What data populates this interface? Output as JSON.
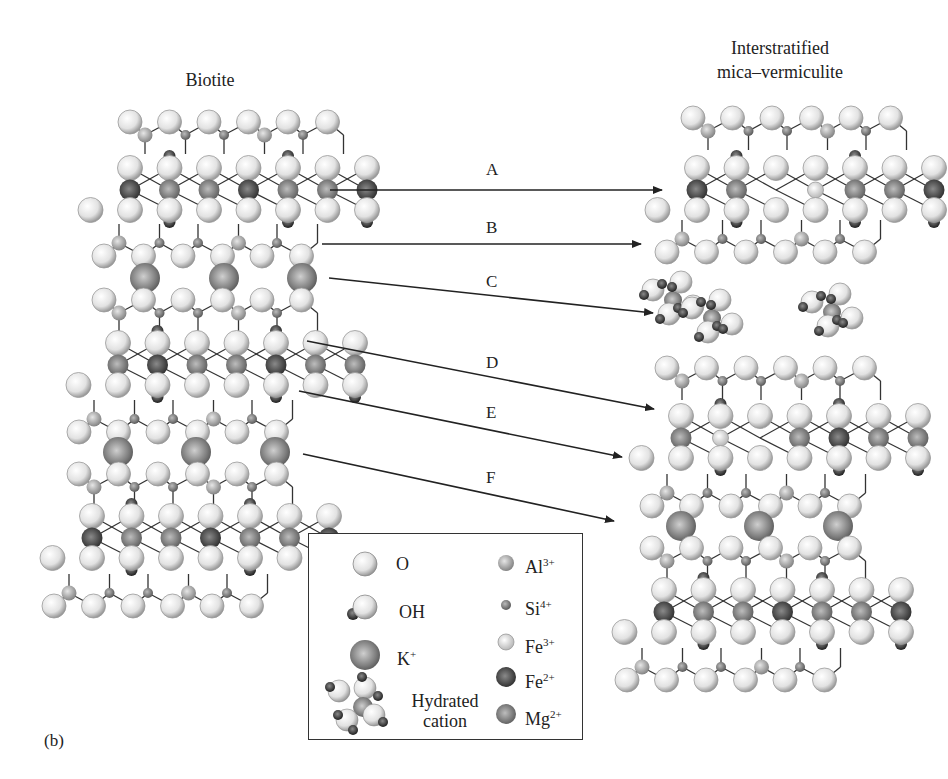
{
  "titles": {
    "left": "Biotite",
    "right_line1": "Interstratified",
    "right_line2": "mica–vermiculite"
  },
  "panel_label": "(b)",
  "colors": {
    "O": "#e8e8e8",
    "OH_h": "#3a3a3a",
    "K": "#8a8a8a",
    "Al": "#a6a6a6",
    "Si": "#8c8c8c",
    "Fe3": "#ececec",
    "Fe2": "#4a4a4a",
    "Mg": "#777777",
    "bond": "#333333",
    "arrow": "#222222"
  },
  "arrows": [
    {
      "label": "A",
      "x1": 330,
      "y1": 190,
      "x2": 662,
      "y2": 190,
      "lx": 486,
      "ly": 160
    },
    {
      "label": "B",
      "x1": 322,
      "y1": 244,
      "x2": 641,
      "y2": 244,
      "lx": 486,
      "ly": 218
    },
    {
      "label": "C",
      "x1": 329,
      "y1": 278,
      "x2": 653,
      "y2": 313,
      "lx": 486,
      "ly": 272
    },
    {
      "label": "D",
      "x1": 307,
      "y1": 341,
      "x2": 654,
      "y2": 409,
      "lx": 486,
      "ly": 353
    },
    {
      "label": "E",
      "x1": 299,
      "y1": 391,
      "x2": 622,
      "y2": 457,
      "lx": 486,
      "ly": 403
    },
    {
      "label": "F",
      "x1": 303,
      "y1": 454,
      "x2": 614,
      "y2": 521,
      "lx": 486,
      "ly": 468
    }
  ],
  "legend": {
    "items_left": [
      {
        "symbol": "O",
        "label": "O",
        "sup": ""
      },
      {
        "symbol": "OH",
        "label": "OH",
        "sup": ""
      },
      {
        "symbol": "K",
        "label": "K",
        "sup": "+"
      },
      {
        "symbol": "hydrated",
        "label": "Hydrated",
        "label2": "cation",
        "sup": ""
      }
    ],
    "items_right": [
      {
        "symbol": "Al",
        "label": "Al",
        "sup": "3+"
      },
      {
        "symbol": "Si",
        "label": "Si",
        "sup": "4+"
      },
      {
        "symbol": "Fe3",
        "label": "Fe",
        "sup": "3+"
      },
      {
        "symbol": "Fe2",
        "label": "Fe",
        "sup": "2+"
      },
      {
        "symbol": "Mg",
        "label": "Mg",
        "sup": "2+"
      }
    ]
  },
  "structures": {
    "biotite": {
      "x0": 130,
      "pitch": 39.5,
      "layers": [
        {
          "type": "tet",
          "y": 122,
          "shift": 0,
          "count": 6
        },
        {
          "type": "oct",
          "y": 190,
          "shift": 0,
          "cations": [
            "Fe2",
            "Mg",
            "Mg",
            "Fe2",
            "Mg",
            "Mg",
            "Fe2"
          ]
        },
        {
          "type": "tet_inv",
          "y": 256,
          "shift": -26,
          "count": 6
        },
        {
          "type": "K",
          "y": 278,
          "positions": [
            145,
            224,
            302
          ]
        },
        {
          "type": "tet",
          "y": 300,
          "shift": -26,
          "count": 6
        },
        {
          "type": "oct",
          "y": 365,
          "shift": -12,
          "cations": [
            "Mg",
            "Fe2",
            "Mg",
            "Mg",
            "Fe2",
            "Mg",
            "Mg"
          ]
        },
        {
          "type": "tet_inv",
          "y": 432,
          "shift": -51,
          "count": 6
        },
        {
          "type": "K",
          "y": 452,
          "positions": [
            118,
            196,
            275
          ]
        },
        {
          "type": "tet",
          "y": 474,
          "shift": -51,
          "count": 6
        },
        {
          "type": "oct",
          "y": 538,
          "shift": -38,
          "cations": [
            "Fe2",
            "Mg",
            "Mg",
            "Fe2",
            "Mg",
            "Mg",
            "Fe2"
          ]
        },
        {
          "type": "tet_inv",
          "y": 606,
          "shift": -76,
          "count": 6
        }
      ]
    },
    "mica_vermiculite": {
      "x0": 697,
      "pitch": 39.5,
      "layers": [
        {
          "type": "tet",
          "y": 118,
          "shift": -4,
          "count": 6
        },
        {
          "type": "oct",
          "y": 190,
          "shift": 0,
          "cations": [
            "Fe2",
            "Mg",
            "",
            "Fe3",
            "Mg",
            "Mg",
            "Fe2"
          ]
        },
        {
          "type": "tet_inv",
          "y": 252,
          "shift": -30,
          "count": 6
        },
        {
          "type": "hydrated",
          "y": 310,
          "positions": [
            [
              673,
              300
            ],
            [
              712,
              318
            ],
            [
              832,
              312
            ]
          ]
        },
        {
          "type": "tet",
          "y": 368,
          "shift": -30,
          "count": 6
        },
        {
          "type": "oct",
          "y": 438,
          "shift": -16,
          "cations": [
            "Mg",
            "Fe3",
            "",
            "Mg",
            "Fe2",
            "Mg",
            "Mg"
          ]
        },
        {
          "type": "tet_inv",
          "y": 506,
          "shift": -45,
          "count": 6
        },
        {
          "type": "K",
          "y": 526,
          "positions": [
            681,
            759,
            838
          ]
        },
        {
          "type": "tet",
          "y": 548,
          "shift": -45,
          "count": 6
        },
        {
          "type": "oct",
          "y": 612,
          "shift": -33,
          "cations": [
            "Fe2",
            "Mg",
            "Mg",
            "Fe2",
            "Mg",
            "Mg",
            "Fe2"
          ]
        },
        {
          "type": "tet_inv",
          "y": 680,
          "shift": -70,
          "count": 6
        }
      ]
    }
  }
}
